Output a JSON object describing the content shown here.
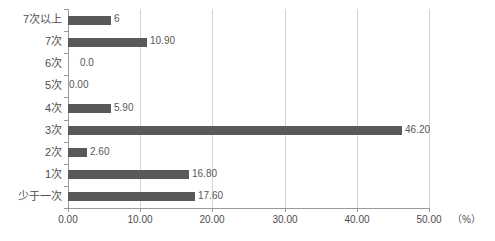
{
  "chart_data": {
    "type": "bar",
    "orientation": "horizontal",
    "title": "",
    "xlabel": "（%）",
    "ylabel": "",
    "xlim": [
      0,
      50
    ],
    "xticks": [
      "0.00",
      "10.00",
      "20.00",
      "30.00",
      "40.00",
      "50.00"
    ],
    "xtick_values": [
      0,
      10,
      20,
      30,
      40,
      50
    ],
    "grid": true,
    "legend": false,
    "bar_color": "#595959",
    "categories": [
      "7次以上",
      "7次",
      "6次",
      "5次",
      "4次",
      "3次",
      "2次",
      "1次",
      "少于一次"
    ],
    "values": [
      6.0,
      10.9,
      0.0,
      0.0,
      5.9,
      46.2,
      2.6,
      16.8,
      17.6
    ],
    "data_labels": [
      "6",
      "10.90",
      "0.0",
      "0.00",
      "5.90",
      "46.20",
      "2.60",
      "16.80",
      "17.60"
    ]
  },
  "axis": {
    "unit": "（%）"
  }
}
